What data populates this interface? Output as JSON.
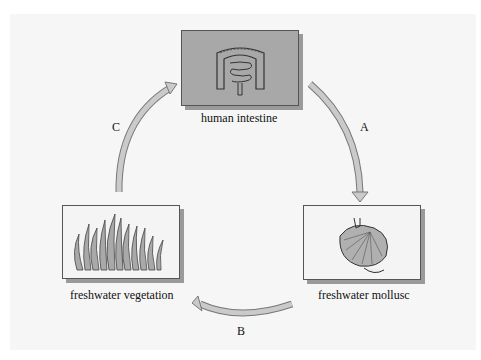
{
  "diagram": {
    "type": "life-cycle",
    "nodes": [
      {
        "id": "intestine",
        "label": "human intestine",
        "icon": "intestine-icon"
      },
      {
        "id": "mollusc",
        "label": "freshwater mollusc",
        "icon": "mollusc-shell-icon"
      },
      {
        "id": "vegetation",
        "label": "freshwater vegetation",
        "icon": "vegetation-icon"
      }
    ],
    "edges": [
      {
        "from": "intestine",
        "to": "mollusc",
        "label": "A"
      },
      {
        "from": "mollusc",
        "to": "vegetation",
        "label": "B"
      },
      {
        "from": "vegetation",
        "to": "intestine",
        "label": "C"
      }
    ],
    "colors": {
      "intestine_box": "#a8a8a8",
      "other_box": "#f4f4f4",
      "arrow_fill": "#c8c8c8",
      "panel": "#f6f6f6"
    }
  }
}
